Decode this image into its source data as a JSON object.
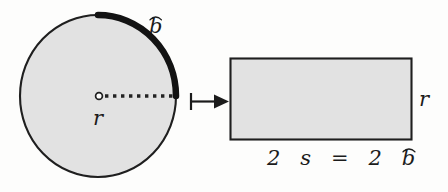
{
  "figure": {
    "background_color": "#fdfdfc",
    "shape_fill_color": "#e2e2e2",
    "stroke_color": "#1b1b1b"
  },
  "circle": {
    "name": "circle",
    "center_marker": "open-dot",
    "radius_label": "r",
    "radius_line_style": "dotted",
    "arc_label_base": "b",
    "arc_label_accent": "arc",
    "arc_label_text": "b̂",
    "arc_highlight_start_deg": 270,
    "arc_highlight_end_deg": 0,
    "geometry": {
      "cx": 98,
      "cy": 96,
      "rx": 78,
      "ry": 81
    }
  },
  "arrow": {
    "name": "transform-arrow",
    "style": "bar-tail-solid-head",
    "direction": "right",
    "geometry": {
      "x1": 190,
      "y1": 101,
      "x2": 228,
      "y2": 101
    }
  },
  "rectangle": {
    "name": "rectangle",
    "height_label": "r",
    "base_label_parts": {
      "two_a": "2",
      "s": "s",
      "equals": "=",
      "two_b": "2",
      "b": "b",
      "b_accent": "arc"
    },
    "base_label_text": "2 s = 2 b̂",
    "geometry": {
      "x": 230,
      "y": 58,
      "width": 182,
      "height": 82
    }
  }
}
